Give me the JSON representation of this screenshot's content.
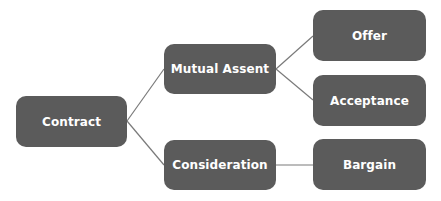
{
  "diagram": {
    "type": "tree",
    "colors": {
      "node_fill": "#5b5b5b",
      "node_text": "#ffffff",
      "connector": "#7a7a7a",
      "background": "#ffffff"
    },
    "nodes": {
      "contract": {
        "label": "Contract"
      },
      "mutual_assent": {
        "label": "Mutual Assent"
      },
      "consideration": {
        "label": "Consideration"
      },
      "offer": {
        "label": "Offer"
      },
      "acceptance": {
        "label": "Acceptance"
      },
      "bargain": {
        "label": "Bargain"
      }
    },
    "edges": [
      {
        "from": "Contract",
        "to": "Mutual Assent"
      },
      {
        "from": "Contract",
        "to": "Consideration"
      },
      {
        "from": "Mutual Assent",
        "to": "Offer"
      },
      {
        "from": "Mutual Assent",
        "to": "Acceptance"
      },
      {
        "from": "Consideration",
        "to": "Bargain"
      }
    ]
  }
}
